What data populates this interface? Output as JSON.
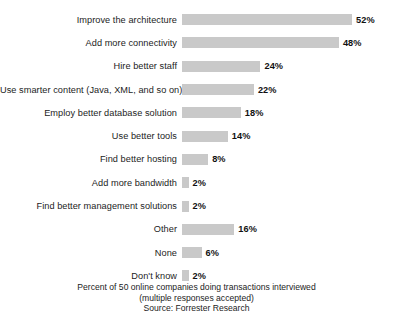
{
  "chart_data": {
    "type": "bar",
    "orientation": "horizontal",
    "title": "",
    "subtitle": "",
    "xlabel": "",
    "ylabel": "",
    "xlim": [
      0,
      52
    ],
    "grid": false,
    "legend": null,
    "bar_color": "#c9c9c9",
    "value_suffix": "%",
    "categories": [
      "Improve the architecture",
      "Add more connectivity",
      "Hire better staff",
      "Use smarter content (Java, XML, and so on)",
      "Employ better database solution",
      "Use better tools",
      "Find better hosting",
      "Add more bandwidth",
      "Find better management solutions",
      "Other",
      "None",
      "Don't know"
    ],
    "values": [
      52,
      48,
      24,
      22,
      18,
      14,
      8,
      2,
      2,
      16,
      6,
      2
    ],
    "value_labels": [
      "52%",
      "48%",
      "24%",
      "22%",
      "18%",
      "14%",
      "8%",
      "2%",
      "2%",
      "16%",
      "6%",
      "2%"
    ],
    "annotations": [
      "Percent of 50 online companies doing transactions interviewed",
      "(multiple responses accepted)",
      "Source: Forrester Research"
    ]
  },
  "caption": {
    "line1": "Percent of 50 online companies doing transactions interviewed",
    "line2": "(multiple responses accepted)",
    "line3": "Source: Forrester Research"
  }
}
